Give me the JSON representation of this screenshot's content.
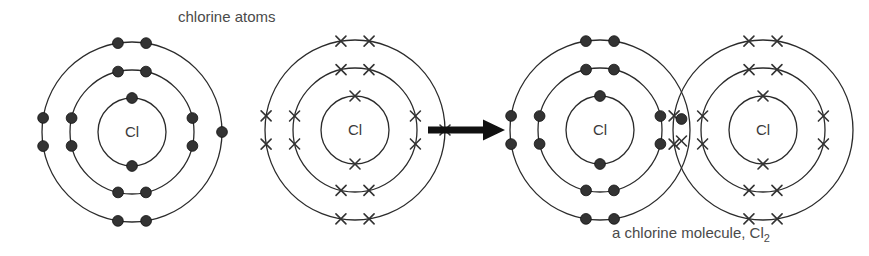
{
  "title": "chlorine atoms",
  "molecule_caption": {
    "text": "a chlorine molecule, Cl",
    "subscript": "2"
  },
  "nucleus_symbol": "Cl",
  "colors": {
    "shell_stroke": "#2b2b2b",
    "electron_dot": "#333333",
    "electron_cross": "#333333",
    "arrow": "#111111",
    "text": "#4a4a4a",
    "background": "#ffffff"
  },
  "diagram": {
    "type": "bohr-electron-shell-diagram",
    "element": "chlorine",
    "atomic_number": 17,
    "shell_occupancy": [
      2,
      8,
      7
    ],
    "shell_radii": [
      34,
      62,
      90
    ],
    "reaction": "2 Cl atoms form a Cl2 molecule by sharing one electron pair (covalent bond)",
    "atoms": [
      {
        "id": "atom-left",
        "label": "chlorine atom (dots)",
        "marker": "dot",
        "cx": 132,
        "cy": 132,
        "bonded": false
      },
      {
        "id": "atom-right",
        "label": "chlorine atom (crosses)",
        "marker": "cross",
        "cx": 355,
        "cy": 130,
        "bonded": false
      },
      {
        "id": "molecule-atom-left",
        "label": "bonded chlorine atom (dots)",
        "marker": "dot",
        "cx": 600,
        "cy": 130,
        "bonded": true
      },
      {
        "id": "molecule-atom-right",
        "label": "bonded chlorine atom (crosses)",
        "marker": "cross",
        "cx": 763,
        "cy": 130,
        "bonded": true
      }
    ],
    "arrow": {
      "label": "reaction-arrow",
      "x1": 428,
      "x2": 505,
      "y": 130
    },
    "shared_pair": {
      "label": "shared electron pair in overlap region",
      "dot_count": 1,
      "cross_count": 1
    }
  }
}
